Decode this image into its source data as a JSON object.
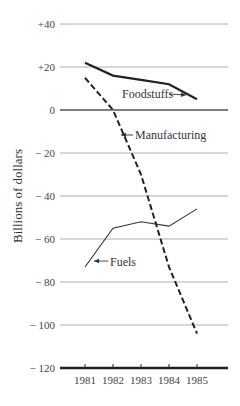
{
  "chart_data": {
    "type": "line",
    "title": "",
    "xlabel": "",
    "ylabel": "Billions of dollars",
    "x": [
      "1981",
      "1982",
      "1983",
      "1984",
      "1985"
    ],
    "ylim": [
      -120,
      40
    ],
    "yticks": [
      40,
      20,
      0,
      -20,
      -40,
      -60,
      -80,
      -100,
      -120
    ],
    "ytick_labels": [
      "+40",
      "+20",
      "0",
      "− 20",
      "− 40",
      "− 60",
      "− 80",
      "− 100",
      "− 120"
    ],
    "grid": true,
    "legend": "inline labels with arrows",
    "series": [
      {
        "name": "Foodstuffs",
        "style": "solid-thick",
        "values": [
          22,
          16,
          14,
          12,
          5
        ]
      },
      {
        "name": "Manufacturing",
        "style": "dashed",
        "values": [
          15,
          0,
          -30,
          -73,
          -104
        ]
      },
      {
        "name": "Fuels",
        "style": "solid-thin",
        "values": [
          -73,
          -55,
          -52,
          -54,
          -46
        ]
      }
    ]
  }
}
